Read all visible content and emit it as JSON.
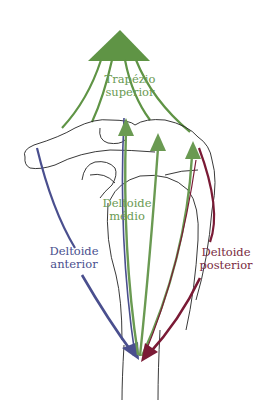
{
  "diagram": {
    "labels": {
      "trapezio_line1": "Trapézio",
      "trapezio_line2": "superior",
      "medio_line1": "Deltoide",
      "medio_line2": "médio",
      "anterior_line1": "Deltoide",
      "anterior_line2": "anterior",
      "posterior_line1": "Deltoide",
      "posterior_line2": "posterior"
    },
    "colors": {
      "trapezio": "#5f9445",
      "deltoide_medio": "#6a9a52",
      "deltoide_anterior": "#4a4f8e",
      "deltoide_posterior": "#7a1a35",
      "outline": "#222222"
    }
  }
}
